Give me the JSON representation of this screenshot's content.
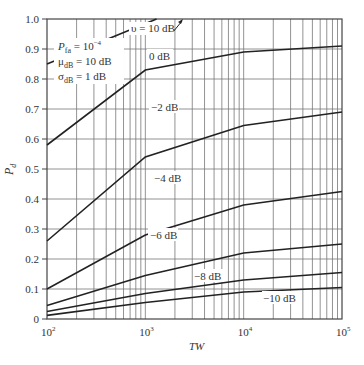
{
  "chart_data": {
    "type": "line",
    "title": "",
    "xlabel": "TW",
    "ylabel": "P_d",
    "xscale": "log",
    "xlim": [
      100,
      100000
    ],
    "ylim": [
      0,
      1.0
    ],
    "grid": true,
    "x_ticks": [
      {
        "value": 100,
        "base": "10",
        "exp": "2"
      },
      {
        "value": 1000,
        "base": "10",
        "exp": "3"
      },
      {
        "value": 10000,
        "base": "10",
        "exp": "4"
      },
      {
        "value": 100000,
        "base": "10",
        "exp": "5"
      }
    ],
    "y_ticks": [
      "0",
      "0.1",
      "0.2",
      "0.3",
      "0.4",
      "0.5",
      "0.6",
      "0.7",
      "0.8",
      "0.9",
      "1.0"
    ],
    "x": [
      100,
      1000,
      10000,
      100000
    ],
    "series": [
      {
        "name": "υ = 10 dB",
        "label": "υ = 10 dB",
        "values": [
          0.85,
          1.0,
          1.0,
          1.0
        ],
        "points": [
          [
            100,
            0.85
          ],
          [
            1300,
            1.0
          ]
        ]
      },
      {
        "name": "0 dB",
        "label": "0 dB",
        "values": [
          0.58,
          0.83,
          0.89,
          0.91
        ]
      },
      {
        "name": "−2 dB",
        "label": "−2 dB",
        "values": [
          0.26,
          0.54,
          0.645,
          0.69
        ]
      },
      {
        "name": "−4 dB",
        "label": "−4 dB",
        "values": [
          0.1,
          0.28,
          0.38,
          0.425
        ]
      },
      {
        "name": "−6 dB",
        "label": "−6 dB",
        "values": [
          0.045,
          0.145,
          0.22,
          0.25
        ]
      },
      {
        "name": "−8 dB",
        "label": "−8 dB",
        "values": [
          0.025,
          0.085,
          0.13,
          0.155
        ]
      },
      {
        "name": "−10 dB",
        "label": "−10 dB",
        "values": [
          0.012,
          0.055,
          0.09,
          0.105
        ]
      }
    ],
    "annotations": [
      {
        "text": "P_fa = 10^-4"
      },
      {
        "text": "μ_dB = 10 dB"
      },
      {
        "text": "σ_dB = 1 dB"
      }
    ]
  },
  "legend": {
    "pfa_main": "P",
    "pfa_sub": "fa",
    "pfa_rest": " = 10",
    "pfa_exp": "−4",
    "mu_main": "μ",
    "mu_sub": "dB",
    "mu_rest": " = 10 dB",
    "sigma_main": "σ",
    "sigma_sub": "dB",
    "sigma_rest": " = 1 dB"
  },
  "labels": {
    "s10": "υ = 10 dB",
    "s0": "0 dB",
    "s_2": "−2 dB",
    "s_4": "−4 dB",
    "s_6": "−6 dB",
    "s_8": "−8 dB",
    "s_10": "−10 dB",
    "xlabel": "TW",
    "ylabel_main": "P",
    "ylabel_sub": "d"
  }
}
